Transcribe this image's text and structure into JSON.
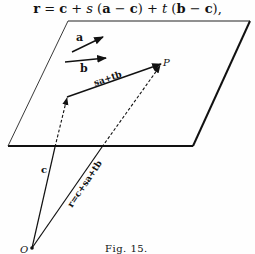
{
  "equation": {
    "lhs": "r",
    "text": "r = c + s (a − c) + t (b − c),"
  },
  "figure": {
    "caption": "Fig. 15.",
    "origin_label": "O",
    "point_label": "P",
    "vector_a_label": "a",
    "vector_b_label": "b",
    "vector_c_label": "c",
    "in_plane_label": "sa+tb",
    "position_label": "r=c+sa+tb"
  },
  "colors": {
    "ink": "#111111",
    "paper": "#fefefe"
  }
}
